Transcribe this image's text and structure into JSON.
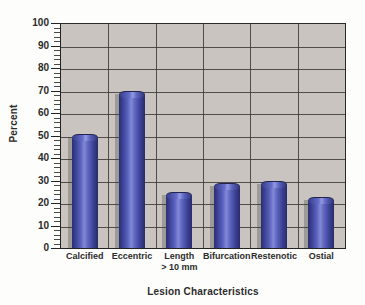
{
  "chart_data": {
    "type": "bar",
    "title": "",
    "xlabel": "Lesion Characteristics",
    "ylabel": "Percent",
    "categories": [
      "Calcified",
      "Eccentric",
      "Length > 10 mm",
      "Bifurcation",
      "Restenotic",
      "Ostial"
    ],
    "category_lines": [
      [
        "Calcified"
      ],
      [
        "Eccentric"
      ],
      [
        "Length",
        "> 10 mm"
      ],
      [
        "Bifurcation"
      ],
      [
        "Restenotic"
      ],
      [
        "Ostial"
      ]
    ],
    "values": [
      50,
      69,
      24,
      28,
      29,
      22
    ],
    "ylim": [
      0,
      100
    ],
    "ytick_labels": [
      "100",
      "90",
      "80",
      "70",
      "60",
      "50",
      "40",
      "30",
      "20",
      "10",
      "0"
    ],
    "ytick_values": [
      100,
      90,
      80,
      70,
      60,
      50,
      40,
      30,
      20,
      10,
      0
    ],
    "ytick_step": 10,
    "grid": "horizontal-and-category-dividers",
    "legend": "none",
    "bar_color": "#4b52a8",
    "bar_highlight_color": "#8289d6",
    "bar_shade_color": "#2a2f72",
    "plot_background_color": "#c9c4bf",
    "figure_background_color": "#fdfdfc",
    "axis_color": "#232323",
    "gridline_color": "#3a3a38"
  }
}
